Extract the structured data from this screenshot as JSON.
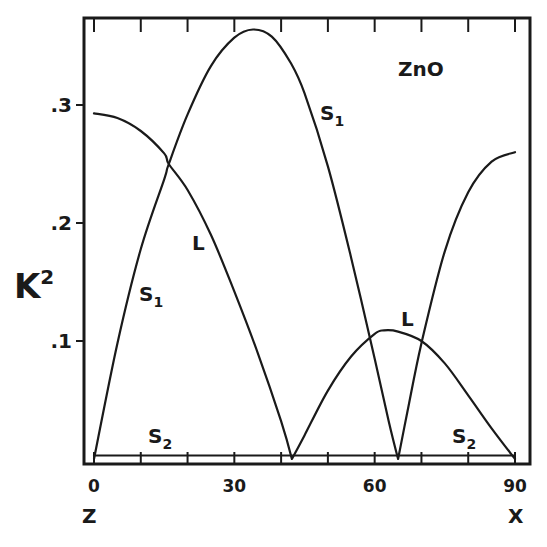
{
  "chart_data": {
    "type": "line",
    "title": "ZnO",
    "xlabel": "",
    "ylabel": "K²",
    "x_axis_start_label": "Z",
    "x_axis_end_label": "X",
    "xlim": [
      0,
      90
    ],
    "ylim": [
      0,
      0.37
    ],
    "x_ticks": [
      0,
      10,
      20,
      30,
      40,
      50,
      60,
      70,
      80,
      90
    ],
    "x_tick_labels": [
      {
        "value": 0,
        "label": "0"
      },
      {
        "value": 30,
        "label": "30"
      },
      {
        "value": 60,
        "label": "60"
      },
      {
        "value": 90,
        "label": "90"
      }
    ],
    "y_tick_labels": [
      {
        "value": 0.1,
        "label": ".1"
      },
      {
        "value": 0.2,
        "label": ".2"
      },
      {
        "value": 0.3,
        "label": ".3"
      }
    ],
    "grid": false,
    "legend": "inline curve labels",
    "series": [
      {
        "name": "L",
        "x": [
          0,
          5,
          10,
          15,
          16,
          20,
          25,
          30,
          35,
          40,
          42.3,
          45,
          50,
          55,
          60,
          62,
          65,
          70,
          75,
          80,
          85,
          90
        ],
        "y": [
          0.293,
          0.289,
          0.278,
          0.259,
          0.25,
          0.228,
          0.19,
          0.142,
          0.09,
          0.032,
          0.0,
          0.02,
          0.058,
          0.087,
          0.106,
          0.109,
          0.108,
          0.1,
          0.081,
          0.054,
          0.026,
          0.0
        ]
      },
      {
        "name": "S1",
        "x": [
          0,
          5,
          10,
          15,
          16,
          20,
          25,
          30,
          34,
          38,
          42,
          45,
          50,
          55,
          60,
          63,
          65,
          67,
          70,
          75,
          80,
          85,
          90
        ],
        "y": [
          0.0,
          0.098,
          0.178,
          0.237,
          0.25,
          0.292,
          0.333,
          0.357,
          0.364,
          0.358,
          0.336,
          0.31,
          0.248,
          0.17,
          0.085,
          0.032,
          0.0,
          0.04,
          0.098,
          0.176,
          0.226,
          0.252,
          0.26
        ]
      },
      {
        "name": "S2",
        "x": [
          0,
          30,
          60,
          90
        ],
        "y": [
          0.003,
          0.003,
          0.003,
          0.003
        ]
      }
    ],
    "annotations": [
      {
        "text": "ZnO",
        "x": 63,
        "y": 0.345
      },
      {
        "text": "S1",
        "x": 50,
        "y": 0.29
      },
      {
        "text": "S1",
        "x": 11,
        "y": 0.145
      },
      {
        "text": "L",
        "x": 23,
        "y": 0.195
      },
      {
        "text": "L",
        "x": 65,
        "y": 0.12
      },
      {
        "text": "S2",
        "x": 13,
        "y": 0.012
      },
      {
        "text": "S2",
        "x": 80,
        "y": 0.018
      }
    ]
  },
  "labels": {
    "title": "ZnO",
    "ylabel_main": "K",
    "ylabel_sup": "2",
    "x_start": "Z",
    "x_end": "X",
    "s": "S",
    "sub1": "1",
    "sub2": "2",
    "l": "L"
  }
}
